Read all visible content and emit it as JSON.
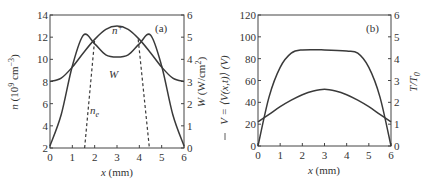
{
  "chart_data": [
    {
      "panel": "(a)",
      "type": "line",
      "xlabel": "x (mm)",
      "ylabel_left": "n (10^9 cm^-3)",
      "ylabel_right": "W (W/cm^2)",
      "xlim": [
        0,
        6
      ],
      "ylim_left": [
        2,
        14
      ],
      "ylim_right": [
        0,
        6
      ],
      "xticks": [
        "0",
        "1",
        "2",
        "3",
        "4",
        "5",
        "6"
      ],
      "yticks_left": [
        "2",
        "4",
        "6",
        "8",
        "10",
        "12",
        "14"
      ],
      "yticks_right": [
        "0",
        "1",
        "2",
        "3",
        "4",
        "5",
        "6"
      ],
      "annotations": [
        "(a)",
        "n+",
        "W",
        "ne"
      ],
      "series": [
        {
          "name": "n+",
          "axis": "left",
          "style": "solid",
          "x": [
            0,
            0.5,
            1,
            1.5,
            2,
            2.5,
            3,
            3.5,
            4,
            4.5,
            5,
            5.5,
            6
          ],
          "values": [
            8.0,
            8.3,
            9.3,
            10.6,
            11.8,
            12.7,
            13.0,
            12.7,
            11.8,
            10.6,
            9.3,
            8.3,
            8.0
          ]
        },
        {
          "name": "W",
          "axis": "right",
          "style": "solid",
          "x": [
            0,
            0.5,
            1,
            1.5,
            2,
            2.5,
            3,
            3.5,
            4,
            4.5,
            5,
            5.5,
            6
          ],
          "values": [
            0.1,
            1.5,
            3.7,
            5.1,
            4.7,
            4.2,
            4.1,
            4.2,
            4.7,
            5.1,
            3.7,
            1.5,
            0.1
          ]
        },
        {
          "name": "ne",
          "axis": "left",
          "style": "dashed",
          "x": [
            1.55,
            2.0,
            3.0,
            3.95,
            4.45
          ],
          "values": [
            2.0,
            11.8,
            12.0,
            11.8,
            2.0
          ]
        }
      ]
    },
    {
      "panel": "(b)",
      "type": "line",
      "xlabel": "x (mm)",
      "ylabel_left": "V̄ = ⟨V(x,t)⟩ (V)",
      "ylabel_right": "T/T0",
      "xlim": [
        0,
        6
      ],
      "ylim_left": [
        0,
        120
      ],
      "ylim_right": [
        0,
        6
      ],
      "xticks": [
        "0",
        "1",
        "2",
        "3",
        "4",
        "5",
        "6"
      ],
      "yticks_left": [
        "0",
        "20",
        "40",
        "60",
        "80",
        "100",
        "120"
      ],
      "yticks_right": [
        "0",
        "1",
        "2",
        "3",
        "4",
        "5",
        "6"
      ],
      "annotations": [
        "(b)"
      ],
      "series": [
        {
          "name": "V (mean potential)",
          "axis": "left",
          "style": "solid",
          "x": [
            0,
            0.5,
            1,
            1.5,
            2,
            3,
            4,
            4.5,
            5,
            5.5,
            6
          ],
          "values": [
            0,
            45,
            72,
            85,
            88,
            88,
            87,
            85,
            72,
            45,
            0
          ]
        },
        {
          "name": "T/T0",
          "axis": "right",
          "style": "solid",
          "x": [
            0,
            0.5,
            1,
            1.5,
            2,
            2.5,
            3,
            3.5,
            4,
            4.5,
            5,
            5.5,
            6
          ],
          "values": [
            1.1,
            1.45,
            1.8,
            2.1,
            2.35,
            2.52,
            2.6,
            2.52,
            2.35,
            2.1,
            1.8,
            1.45,
            1.1
          ]
        }
      ]
    }
  ],
  "labels": {
    "a": {
      "panel": "(a)",
      "n_plus": "n",
      "n_plus_sub": "+",
      "w": "W",
      "ne": "n",
      "ne_sub": "e",
      "xlabel_var": "x",
      "xlabel_unit": " (mm)",
      "ylabel_left_var": "n",
      "ylabel_left_unit": " (10",
      "ylabel_left_exp": "9",
      "ylabel_left_unit2": " cm",
      "ylabel_left_exp2": "−3",
      "ylabel_left_close": ")",
      "ylabel_right_var": "W",
      "ylabel_right_unit": " (W/cm",
      "ylabel_right_exp": "2",
      "ylabel_right_close": ")"
    },
    "b": {
      "panel": "(b)",
      "xlabel_var": "x",
      "xlabel_unit": " (mm)",
      "ylabel_left": "V = ⟨V(x,t)⟩ (V)",
      "ylabel_right": "T/T",
      "ylabel_right_sub": "0"
    }
  }
}
